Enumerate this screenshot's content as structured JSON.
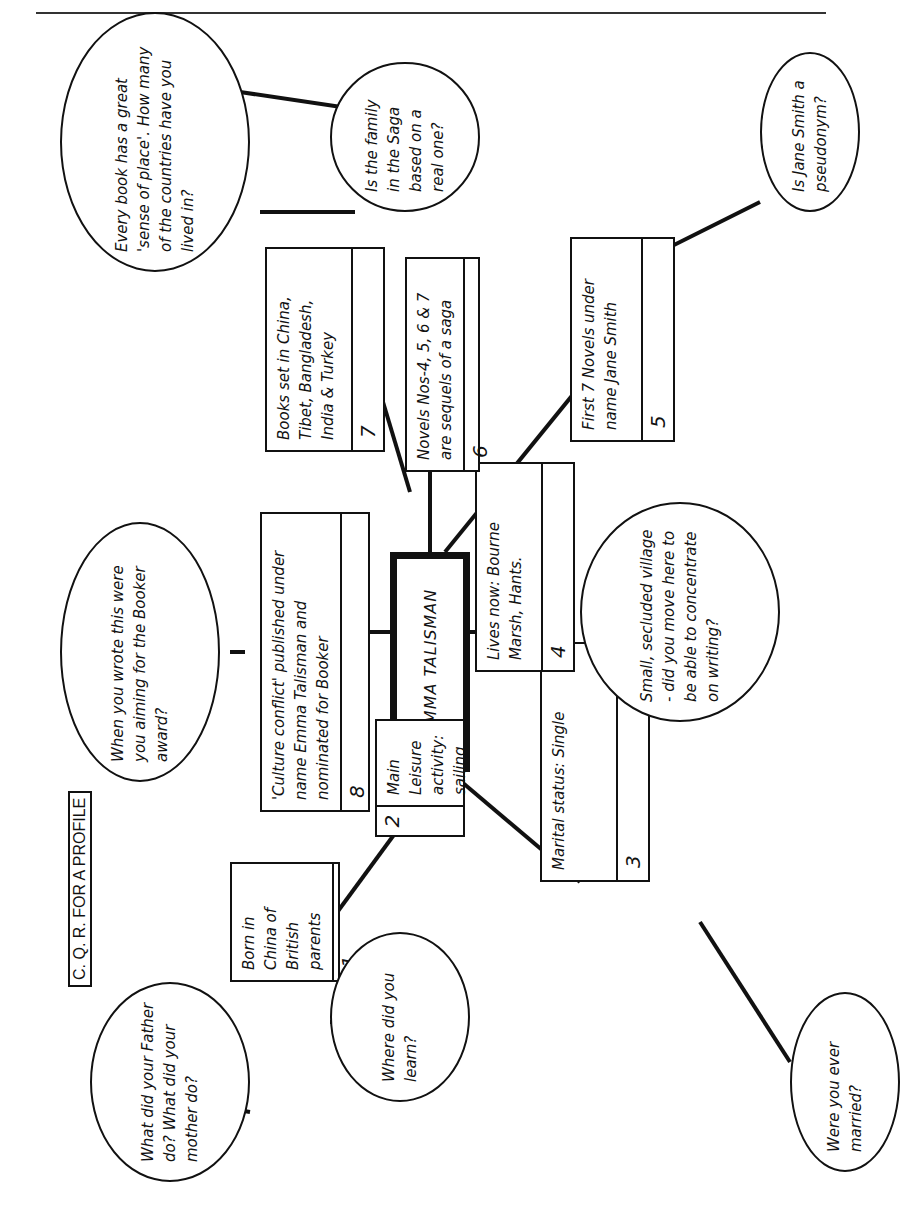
{
  "title": "C. Q. R. FOR A PROFILE",
  "center": "EMMA TALISMAN",
  "facts": [
    {
      "number": "1",
      "text": "Born in China of British parents"
    },
    {
      "number": "2",
      "text": "Main Leisure activity: sailing"
    },
    {
      "number": "3",
      "text": "Marital status: Single"
    },
    {
      "number": "4",
      "text": "Lives now: Bourne Marsh, Hants."
    },
    {
      "number": "5",
      "text": "First 7 Novels under name Jane Smith"
    },
    {
      "number": "6",
      "text": "Novels Nos-4, 5, 6 & 7 are sequels of a saga"
    },
    {
      "number": "7",
      "text": "Books set in China, Tibet, Bangladesh, India & Turkey"
    },
    {
      "number": "8",
      "text": "'Culture conflict' published under name Emma Talisman and nominated for Booker"
    }
  ],
  "questions": [
    {
      "for": "1",
      "text": "What did your Father do? What did your mother do?"
    },
    {
      "for": "2",
      "text": "Where did you learn?"
    },
    {
      "for": "3",
      "text": "Were you ever married?"
    },
    {
      "for": "4",
      "text": "Small, secluded village - did you move here to be able to concentrate on writing?"
    },
    {
      "for": "5",
      "text": "Is Jane Smith a pseudonym?"
    },
    {
      "for": "6",
      "text": "Is the family in the Saga based on a real one?"
    },
    {
      "for": "7",
      "text": "Every book has a great 'sense of place'. How many of the countries have you lived in?"
    },
    {
      "for": "8",
      "text": "When you wrote this were you aiming for the Booker award?"
    }
  ]
}
